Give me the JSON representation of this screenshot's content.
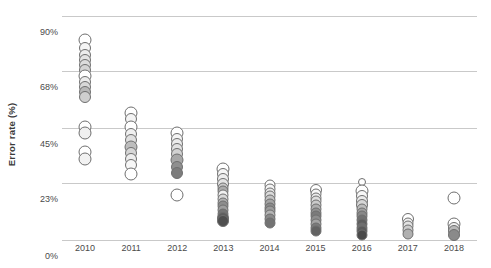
{
  "chart_data": {
    "type": "scatter",
    "title": "",
    "xlabel": "",
    "ylabel": "Error rate (%)",
    "xlim": [
      2009.5,
      2018.5
    ],
    "ylim": [
      0,
      90
    ],
    "grid": "horizontal",
    "legend": "none",
    "y_ticks": [
      {
        "value": 90,
        "label": "90%"
      },
      {
        "value": 68,
        "label": "68%"
      },
      {
        "value": 45,
        "label": "45%"
      },
      {
        "value": 23,
        "label": "23%"
      },
      {
        "value": 0,
        "label": "0%"
      }
    ],
    "x_ticks": [
      {
        "value": 2010,
        "label": "2010"
      },
      {
        "value": 2011,
        "label": "2011"
      },
      {
        "value": 2012,
        "label": "2012"
      },
      {
        "value": 2013,
        "label": "2013"
      },
      {
        "value": 2014,
        "label": "2014"
      },
      {
        "value": 2015,
        "label": "2015"
      },
      {
        "value": 2016,
        "label": "2016"
      },
      {
        "value": 2017,
        "label": "2017"
      },
      {
        "value": 2018,
        "label": "2018"
      }
    ],
    "marker": {
      "shape": "circle",
      "edge_color": "#6f6f6f",
      "fill_palette": [
        "#ffffff",
        "#f2f2f2",
        "#e0e0e0",
        "#cfcfcf",
        "#b5b5b5",
        "#9a9a9a",
        "#808080",
        "#636363",
        "#4a4a4a"
      ]
    },
    "series": [
      {
        "name": "2010",
        "x": 2010,
        "values": [
          80.5,
          77.0,
          74.5,
          72.5,
          70.5,
          68.5,
          66.0,
          63.5,
          61.5,
          59.5,
          57.5,
          45.5,
          43.0,
          35.5,
          32.5
        ],
        "sizes": [
          13,
          12,
          12,
          12,
          12,
          12,
          13,
          12,
          12,
          12,
          12,
          13,
          13,
          13,
          13
        ],
        "fills": [
          "#ffffff",
          "#f5f5f5",
          "#ededed",
          "#e4e4e4",
          "#dcdcdc",
          "#d4d4d4",
          "#ffffff",
          "#ececec",
          "#d8d8d8",
          "#b8b8b8",
          "#cfcfcf",
          "#ffffff",
          "#f0f0f0",
          "#ffffff",
          "#f2f2f2"
        ]
      },
      {
        "name": "2011",
        "x": 2011,
        "values": [
          51.0,
          48.5,
          45.5,
          42.5,
          40.0,
          37.5,
          35.0,
          32.5,
          30.0,
          26.5
        ],
        "sizes": [
          13,
          12,
          13,
          12,
          12,
          13,
          12,
          12,
          12,
          13
        ],
        "fills": [
          "#ffffff",
          "#f4f4f4",
          "#ffffff",
          "#f0f0f0",
          "#e0e0e0",
          "#bdbdbd",
          "#d6d6d6",
          "#ededed",
          "#f7f7f7",
          "#ffffff"
        ]
      },
      {
        "name": "2012",
        "x": 2012,
        "values": [
          43.0,
          40.5,
          38.5,
          36.5,
          34.5,
          32.0,
          29.5,
          27.0,
          18.0
        ],
        "sizes": [
          13,
          12,
          12,
          12,
          12,
          13,
          12,
          12,
          13
        ],
        "fills": [
          "#ffffff",
          "#f4f4f4",
          "#ebebeb",
          "#e2e2e2",
          "#d2d2d2",
          "#a8a8a8",
          "#8f8f8f",
          "#7d7d7d",
          "#ffffff"
        ]
      },
      {
        "name": "2013",
        "x": 2013,
        "values": [
          28.5,
          26.5,
          24.5,
          22.5,
          21.0,
          19.5,
          18.0,
          16.5,
          15.0,
          13.5,
          12.0,
          10.5,
          9.0,
          7.5
        ],
        "sizes": [
          13,
          12,
          12,
          12,
          11,
          11,
          11,
          11,
          11,
          11,
          11,
          11,
          12,
          12
        ],
        "fills": [
          "#ffffff",
          "#f6f6f6",
          "#ededed",
          "#e4e4e4",
          "#c9c9c9",
          "#ababab",
          "#f0f0f0",
          "#d8d8d8",
          "#b0b0b0",
          "#8d8d8d",
          "#9e9e9e",
          "#767676",
          "#5f5f5f",
          "#4f4f4f"
        ]
      },
      {
        "name": "2014",
        "x": 2014,
        "values": [
          22.0,
          20.5,
          19.0,
          17.5,
          16.0,
          14.5,
          13.0,
          11.5,
          10.0,
          8.5,
          7.0
        ],
        "sizes": [
          11,
          11,
          11,
          11,
          11,
          11,
          11,
          11,
          11,
          11,
          11
        ],
        "fills": [
          "#ffffff",
          "#f4f4f4",
          "#e8e8e8",
          "#dadada",
          "#c2c2c2",
          "#a5a5a5",
          "#8c8c8c",
          "#9c9c9c",
          "#b4b4b4",
          "#8a8a8a",
          "#737373"
        ]
      },
      {
        "name": "2015",
        "x": 2015,
        "values": [
          20.0,
          18.5,
          17.0,
          15.5,
          14.0,
          12.5,
          11.0,
          9.5,
          8.0,
          6.5,
          5.0,
          3.5
        ],
        "sizes": [
          12,
          11,
          11,
          11,
          11,
          11,
          11,
          11,
          11,
          11,
          11,
          11
        ],
        "fills": [
          "#ffffff",
          "#f7f7f7",
          "#ececec",
          "#dedede",
          "#cacaca",
          "#aeaeae",
          "#929292",
          "#7b7b7b",
          "#8e8e8e",
          "#a3a3a3",
          "#7a7a7a",
          "#636363"
        ]
      },
      {
        "name": "2016",
        "x": 2016,
        "values": [
          23.5,
          19.5,
          17.5,
          15.5,
          14.0,
          12.5,
          11.0,
          9.5,
          8.0,
          6.5,
          5.0,
          3.5,
          2.0
        ],
        "sizes": [
          8,
          13,
          12,
          12,
          12,
          11,
          11,
          11,
          11,
          11,
          11,
          11,
          11
        ],
        "fills": [
          "#ffffff",
          "#ffffff",
          "#f7f7f7",
          "#eaeaea",
          "#d6d6d6",
          "#bcbcbc",
          "#a0a0a0",
          "#888888",
          "#717171",
          "#5e5e5e",
          "#6e6e6e",
          "#5a5a5a",
          "#4a4a4a"
        ]
      },
      {
        "name": "2017",
        "x": 2017,
        "values": [
          8.5,
          7.0,
          5.5,
          4.0,
          2.5
        ],
        "sizes": [
          12,
          11,
          11,
          11,
          11
        ],
        "fills": [
          "#ffffff",
          "#f2f2f2",
          "#e2e2e2",
          "#cccccc",
          "#b0b0b0"
        ]
      },
      {
        "name": "2018",
        "x": 2018,
        "values": [
          17.0,
          6.5,
          5.0,
          3.5,
          2.0
        ],
        "sizes": [
          13,
          13,
          12,
          12,
          12
        ],
        "fills": [
          "#ffffff",
          "#ffffff",
          "#f2f2f2",
          "#b9b9b9",
          "#8a8a8a"
        ]
      }
    ]
  }
}
